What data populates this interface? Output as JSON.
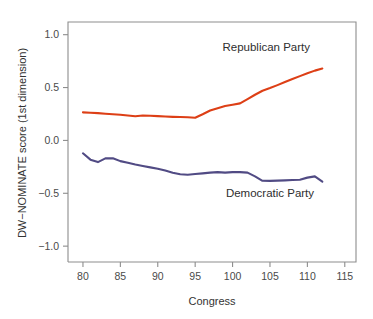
{
  "chart_data": {
    "type": "line",
    "title": "",
    "subtitle": "",
    "xlabel": "Congress",
    "ylabel": "DW−NOMINATE score (1st dimension)",
    "xlim": [
      78.0,
      116.5
    ],
    "ylim": [
      -1.15,
      1.12
    ],
    "xticks": [
      80,
      85,
      90,
      95,
      100,
      105,
      110,
      115
    ],
    "xtick_labels": [
      "80",
      "85",
      "90",
      "95",
      "100",
      "105",
      "110",
      "115"
    ],
    "yticks": [
      1.0,
      0.5,
      0.0,
      -0.5,
      -1.0
    ],
    "ytick_labels": [
      "1.0",
      "0.5",
      "0.0",
      "−0.5",
      "−1.0"
    ],
    "grid": false,
    "legend_position": "inline-annotation",
    "x": [
      80,
      81,
      82,
      83,
      84,
      85,
      86,
      87,
      88,
      89,
      90,
      91,
      92,
      93,
      94,
      95,
      96,
      97,
      98,
      99,
      100,
      101,
      102,
      103,
      104,
      105,
      106,
      107,
      108,
      109,
      110,
      111,
      112
    ],
    "series": [
      {
        "name": "Republican Party",
        "color": "#dd3f16",
        "values": [
          0.265,
          0.262,
          0.258,
          0.252,
          0.247,
          0.243,
          0.236,
          0.228,
          0.236,
          0.233,
          0.23,
          0.226,
          0.223,
          0.221,
          0.219,
          0.215,
          0.248,
          0.283,
          0.305,
          0.325,
          0.338,
          0.35,
          0.39,
          0.432,
          0.47,
          0.495,
          0.523,
          0.552,
          0.58,
          0.608,
          0.635,
          0.66,
          0.68
        ]
      },
      {
        "name": "Democratic Party",
        "color": "#514b84",
        "values": [
          -0.122,
          -0.182,
          -0.205,
          -0.17,
          -0.168,
          -0.196,
          -0.212,
          -0.228,
          -0.242,
          -0.255,
          -0.268,
          -0.285,
          -0.305,
          -0.32,
          -0.325,
          -0.318,
          -0.312,
          -0.305,
          -0.3,
          -0.305,
          -0.3,
          -0.3,
          -0.305,
          -0.34,
          -0.382,
          -0.383,
          -0.38,
          -0.378,
          -0.375,
          -0.372,
          -0.352,
          -0.34,
          -0.39
        ]
      }
    ],
    "annotations": [
      {
        "text": "Republican Party",
        "x": 104.5,
        "y": 0.845,
        "anchor": "middle"
      },
      {
        "text": "Democratic Party",
        "x": 105.0,
        "y": -0.535,
        "anchor": "middle"
      }
    ]
  }
}
